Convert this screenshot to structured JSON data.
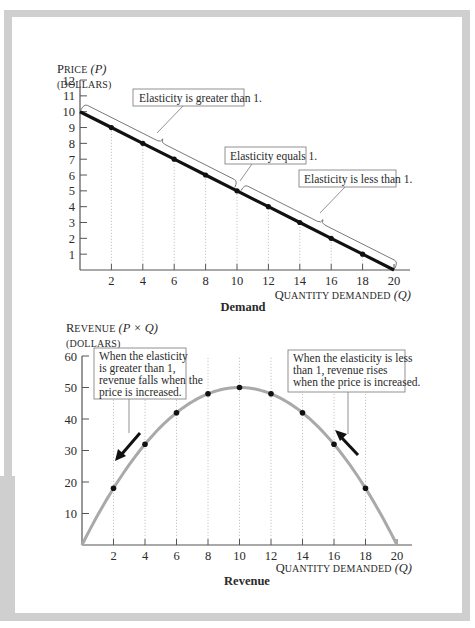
{
  "colors": {
    "frame_gray": "#cfcfcf",
    "axis": "#555555",
    "demand_line": "#111111",
    "revenue_curve": "#a9a9a9",
    "point": "#111111",
    "guide": "#b8b8b8"
  },
  "demand_panel": {
    "ylabel_main_first": "P",
    "ylabel_main_rest": "RICE",
    "ylabel_var": "(P)",
    "ylabel_unit": "(DOLLARS)",
    "xlabel_first": "Q",
    "xlabel_rest": "UANTITY DEMANDED",
    "xlabel_var": "(Q)",
    "caption": "Demand",
    "annotations": [
      "Elasticity is greater than 1.",
      "Elasticity equals 1.",
      "Elasticity is less than 1."
    ]
  },
  "revenue_panel": {
    "ylabel_main_first": "R",
    "ylabel_main_rest": "EVENUE",
    "ylabel_var": "(P × Q)",
    "ylabel_unit": "(DOLLARS)",
    "xlabel_first": "Q",
    "xlabel_rest": "UANTITY DEMANDED",
    "xlabel_var": "(Q)",
    "caption": "Revenue",
    "annotations": [
      [
        "When the elasticity",
        "is greater than 1,",
        "revenue falls when the",
        "price is increased."
      ],
      [
        "When the elasticity is less",
        "than 1, revenue rises",
        "when the price is increased."
      ]
    ]
  },
  "chart_data": [
    {
      "type": "line",
      "title": "Demand",
      "xlabel": "Quantity demanded (Q)",
      "ylabel": "Price (P) (dollars)",
      "x_ticks": [
        2,
        4,
        6,
        8,
        10,
        12,
        14,
        16,
        18,
        20
      ],
      "y_ticks": [
        1,
        2,
        3,
        4,
        5,
        6,
        7,
        8,
        9,
        10,
        11,
        12
      ],
      "xlim": [
        0,
        20
      ],
      "ylim": [
        0,
        12
      ],
      "grid": false,
      "series": [
        {
          "name": "Demand",
          "x": [
            0,
            2,
            4,
            6,
            8,
            10,
            12,
            14,
            16,
            18,
            20
          ],
          "y": [
            10,
            9,
            8,
            7,
            6,
            5,
            4,
            3,
            2,
            1,
            0
          ]
        }
      ],
      "marked_points_x": [
        2,
        4,
        6,
        8,
        10,
        12,
        14,
        16,
        18
      ],
      "annotations": [
        {
          "text": "Elasticity is greater than 1.",
          "range_q": [
            0,
            10
          ]
        },
        {
          "text": "Elasticity equals 1.",
          "at_q": 10
        },
        {
          "text": "Elasticity is less than 1.",
          "range_q": [
            10,
            20
          ]
        }
      ]
    },
    {
      "type": "line",
      "title": "Revenue",
      "xlabel": "Quantity demanded (Q)",
      "ylabel": "Revenue (P × Q) (dollars)",
      "x_ticks": [
        2,
        4,
        6,
        8,
        10,
        12,
        14,
        16,
        18,
        20
      ],
      "y_ticks": [
        10,
        20,
        30,
        40,
        50,
        60
      ],
      "xlim": [
        0,
        20
      ],
      "ylim": [
        0,
        60
      ],
      "grid": false,
      "series": [
        {
          "name": "Revenue",
          "x": [
            0,
            2,
            4,
            6,
            8,
            10,
            12,
            14,
            16,
            18,
            20
          ],
          "y": [
            0,
            18,
            32,
            42,
            48,
            50,
            48,
            42,
            32,
            18,
            0
          ]
        }
      ],
      "annotations": [
        {
          "text": "When the elasticity is greater than 1, revenue falls when the price is increased.",
          "arrow": "down-left",
          "near_q": 3
        },
        {
          "text": "When the elasticity is less than 1, revenue rises when the price is increased.",
          "arrow": "up-left",
          "near_q": 16.5
        }
      ]
    }
  ]
}
